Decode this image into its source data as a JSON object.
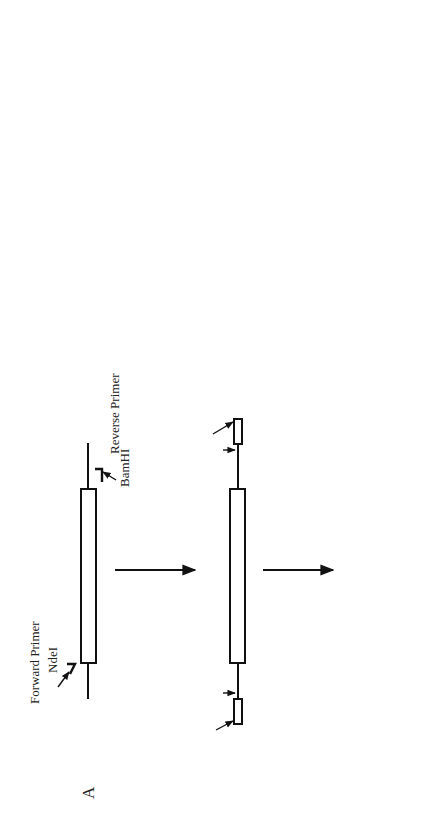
{
  "figure": {
    "orientation": "rotated-90-ccw",
    "panels": [
      {
        "id": "A",
        "label": "A",
        "forward_primer_label": "Forward Primer",
        "forward_site": "NdeI",
        "reverse_primer_label": "Reverse Primer",
        "reverse_site": "BamHI"
      },
      {
        "id": "B",
        "label": "B",
        "left_site": "(SmaI)",
        "left_inner_site": "NdeI",
        "right_inner_site": "BamHI",
        "right_site": "(SmaI)"
      },
      {
        "id": "C",
        "label": "C",
        "left_site": "NdeI",
        "right_site": "BamHI"
      }
    ],
    "steps_A_to_B": [
      "1. PCR",
      "2. Cloning into SmaI site",
      "   of Bluescript KS vector"
    ],
    "steps_B_to_C": {
      "line1_prefix": "1. Amplification of the Fragment in ",
      "line1_italic": "E. coli",
      "line2": "2. Excision with NdeI and BamHI",
      "line3": "3. Cloning into pET3a vector"
    },
    "sequences": {
      "ndei_top_label": "NdeI",
      "primer_prefix": "(N)",
      "primer_prefix_sub": "8",
      "primer_cat": "CAT",
      "primer_atg": "ATG",
      "primer_rest": "GCGCTGCTGGACCT......",
      "primer_label": "Forward Primer",
      "cdna_prefix": "CCCCT",
      "cdna_tac": "TAC",
      "cdna_rest": "CGCGACGACCTGGA......",
      "cdna_label": "cDNA",
      "sd_label": "SD",
      "result_prefix": "AAGGAGATATACAT",
      "result_atg": "ATG",
      "result_rest": "GCGCTGCTGGACCT......",
      "ndei_bottom_label": "NdeI"
    }
  }
}
